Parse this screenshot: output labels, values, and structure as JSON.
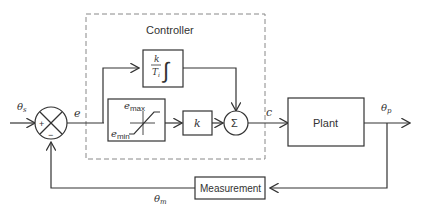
{
  "diagram": {
    "controller_label": "Controller",
    "blocks": {
      "integrator": {
        "numerator": "k",
        "denominator": "T",
        "denominator_sub": "i",
        "symbol": "∫"
      },
      "saturation": {
        "upper": "e",
        "upper_sub": "max",
        "lower": "e",
        "lower_sub": "min"
      },
      "gain": {
        "label": "k"
      },
      "sum": {
        "label": "Σ"
      },
      "plant": {
        "label": "Plant"
      },
      "measurement": {
        "label": "Measurement"
      }
    },
    "comparator": {
      "plus": "+",
      "minus": "−"
    },
    "signals": {
      "setpoint": {
        "main": "θ",
        "sub": "s"
      },
      "error": "e",
      "control": "c",
      "process": {
        "main": "θ",
        "sub": "p"
      },
      "measured": {
        "main": "θ",
        "sub": "m"
      }
    },
    "colors": {
      "line": "#333333",
      "dashed_border": "#888888",
      "background": "#ffffff"
    }
  }
}
